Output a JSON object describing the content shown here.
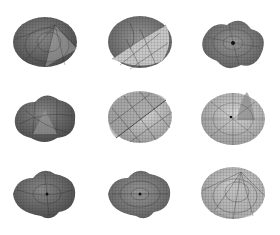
{
  "figure": {
    "layout": {
      "rows": 3,
      "cols": 3
    },
    "colors": {
      "background": "#ffffff",
      "surface_dark": "#555555",
      "surface_light": "#bdbdbd",
      "mesh": "#222222"
    },
    "panels": [
      {
        "row": 1,
        "col": 1,
        "shape": "cone-peak-dark",
        "cx": 45,
        "cy": 42
      },
      {
        "row": 1,
        "col": 2,
        "shape": "folded-saddle-light",
        "cx": 140,
        "cy": 42
      },
      {
        "row": 1,
        "col": 3,
        "shape": "wavy-lobed-dense",
        "cx": 233,
        "cy": 42
      },
      {
        "row": 2,
        "col": 1,
        "shape": "wavy-lobed-dark",
        "cx": 45,
        "cy": 117
      },
      {
        "row": 2,
        "col": 2,
        "shape": "diagonal-fold-light",
        "cx": 140,
        "cy": 117
      },
      {
        "row": 2,
        "col": 3,
        "shape": "gaussian-peak-light",
        "cx": 233,
        "cy": 117
      },
      {
        "row": 3,
        "col": 1,
        "shape": "wavy-lobed-dark",
        "cx": 45,
        "cy": 193
      },
      {
        "row": 3,
        "col": 2,
        "shape": "wavy-lobed-medium",
        "cx": 140,
        "cy": 193
      },
      {
        "row": 3,
        "col": 3,
        "shape": "cone-peak-light",
        "cx": 233,
        "cy": 193
      }
    ]
  }
}
